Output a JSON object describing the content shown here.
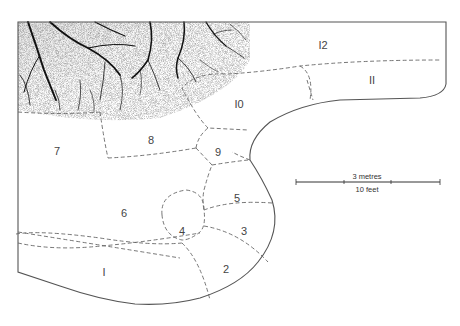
{
  "diagram": {
    "zones": [
      {
        "id": "1",
        "label": "I"
      },
      {
        "id": "2",
        "label": "2"
      },
      {
        "id": "3",
        "label": "3"
      },
      {
        "id": "4",
        "label": "4"
      },
      {
        "id": "5",
        "label": "5"
      },
      {
        "id": "6",
        "label": "6"
      },
      {
        "id": "7",
        "label": "7"
      },
      {
        "id": "8",
        "label": "8"
      },
      {
        "id": "9",
        "label": "9"
      },
      {
        "id": "10",
        "label": "I0"
      },
      {
        "id": "11",
        "label": "II"
      },
      {
        "id": "12",
        "label": "I2"
      }
    ],
    "scale_bar": {
      "metric_label": "3 metres",
      "imperial_label": "10 feet"
    },
    "colors": {
      "line": "#555555",
      "dashed": "#666666",
      "canopy": "#111111",
      "background": "#ffffff"
    }
  }
}
